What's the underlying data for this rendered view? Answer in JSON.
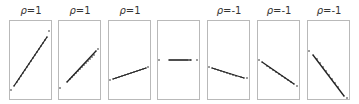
{
  "chart_data": {
    "type": "scatter",
    "title": "",
    "xlabel": "",
    "ylabel": "",
    "grid": false,
    "legend": null,
    "layout": "1x7 small multiples, each panel a boxed scatter plot",
    "panel_frame_color": "#b9b9b9",
    "point_color": "#222222",
    "panels": [
      {
        "title": "ρ=1",
        "rho": 1,
        "description": "perfect positive correlation, steep slope",
        "points": [
          [
            2,
            70
          ],
          [
            5,
            66
          ],
          [
            8,
            62
          ],
          [
            10,
            59
          ],
          [
            12,
            56
          ],
          [
            14,
            53
          ],
          [
            16,
            50
          ],
          [
            18,
            47
          ],
          [
            20,
            44
          ],
          [
            22,
            41
          ],
          [
            24,
            38
          ],
          [
            26,
            35
          ],
          [
            28,
            32
          ],
          [
            30,
            29
          ],
          [
            32,
            26
          ],
          [
            34,
            23
          ],
          [
            36,
            20
          ],
          [
            38,
            17
          ],
          [
            40,
            11
          ]
        ]
      },
      {
        "title": "ρ=1",
        "rho": 1,
        "description": "perfect positive correlation, moderate slope",
        "points": [
          [
            2,
            68
          ],
          [
            9,
            62
          ],
          [
            12,
            59
          ],
          [
            14,
            57
          ],
          [
            16,
            55
          ],
          [
            18,
            53
          ],
          [
            20,
            51
          ],
          [
            22,
            49
          ],
          [
            24,
            47
          ],
          [
            26,
            45
          ],
          [
            28,
            43
          ],
          [
            30,
            41
          ],
          [
            32,
            39
          ],
          [
            34,
            37
          ],
          [
            36,
            35
          ],
          [
            38,
            31
          ],
          [
            40,
            29
          ]
        ]
      },
      {
        "title": "ρ=1",
        "rho": 1,
        "description": "perfect positive correlation, shallow slope",
        "points": [
          [
            2,
            60
          ],
          [
            5,
            59
          ],
          [
            8,
            58
          ],
          [
            11,
            57
          ],
          [
            14,
            56
          ],
          [
            17,
            55
          ],
          [
            20,
            54
          ],
          [
            23,
            53
          ],
          [
            26,
            52
          ],
          [
            29,
            51
          ],
          [
            32,
            50
          ],
          [
            35,
            49
          ],
          [
            38,
            48
          ],
          [
            40,
            47
          ]
        ]
      },
      {
        "title": "",
        "rho": null,
        "description": "zero slope (horizontal line); correlation undefined",
        "points": [
          [
            2,
            40
          ],
          [
            12,
            40
          ],
          [
            14,
            40
          ],
          [
            16,
            40
          ],
          [
            18,
            40
          ],
          [
            20,
            40
          ],
          [
            22,
            40
          ],
          [
            24,
            40
          ],
          [
            26,
            40
          ],
          [
            28,
            40
          ],
          [
            30,
            40
          ],
          [
            34,
            40
          ],
          [
            40,
            40
          ]
        ]
      },
      {
        "title": "ρ=-1",
        "rho": -1,
        "description": "perfect negative correlation, shallow slope",
        "points": [
          [
            2,
            47
          ],
          [
            5,
            48
          ],
          [
            8,
            49
          ],
          [
            11,
            50
          ],
          [
            14,
            51
          ],
          [
            17,
            52
          ],
          [
            20,
            53
          ],
          [
            23,
            54
          ],
          [
            26,
            55
          ],
          [
            29,
            56
          ],
          [
            34,
            57
          ],
          [
            37,
            58
          ],
          [
            40,
            58
          ]
        ]
      },
      {
        "title": "ρ=-1",
        "rho": -1,
        "description": "perfect negative correlation, moderate slope",
        "points": [
          [
            2,
            40
          ],
          [
            5,
            42
          ],
          [
            10,
            46
          ],
          [
            13,
            48
          ],
          [
            16,
            50
          ],
          [
            19,
            52
          ],
          [
            22,
            54
          ],
          [
            25,
            56
          ],
          [
            28,
            58
          ],
          [
            31,
            60
          ],
          [
            34,
            62
          ],
          [
            37,
            64
          ],
          [
            40,
            66
          ]
        ]
      },
      {
        "title": "ρ=-1",
        "rho": -1,
        "description": "perfect negative correlation, steep slope",
        "points": [
          [
            2,
            31
          ],
          [
            6,
            35
          ],
          [
            10,
            39
          ],
          [
            13,
            43
          ],
          [
            16,
            47
          ],
          [
            19,
            51
          ],
          [
            22,
            55
          ],
          [
            25,
            59
          ],
          [
            28,
            63
          ],
          [
            31,
            67
          ],
          [
            37,
            76
          ],
          [
            40,
            78
          ]
        ]
      }
    ]
  },
  "panels": [
    {
      "title_prefix": "ρ",
      "title_suffix": "=1"
    },
    {
      "title_prefix": "ρ",
      "title_suffix": "=1"
    },
    {
      "title_prefix": "ρ",
      "title_suffix": "=1"
    },
    {
      "title_prefix": "",
      "title_suffix": ""
    },
    {
      "title_prefix": "ρ",
      "title_suffix": "=-1"
    },
    {
      "title_prefix": "ρ",
      "title_suffix": "=-1"
    },
    {
      "title_prefix": "ρ",
      "title_suffix": "=-1"
    }
  ],
  "panel_x_positions": [
    9,
    58,
    108,
    157,
    207,
    257,
    307
  ]
}
